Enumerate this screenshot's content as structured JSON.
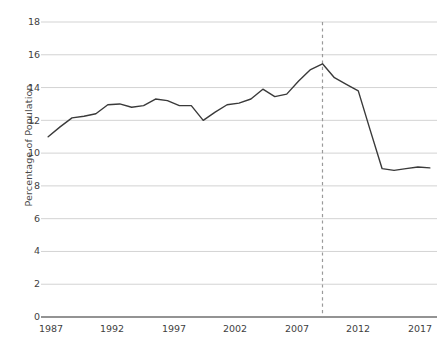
{
  "chart_data": {
    "type": "line",
    "title": "",
    "subtitle": "",
    "xlabel": "",
    "ylabel": "Percentage of Population",
    "xlim": [
      1986.4,
      2019.6
    ],
    "ylim": [
      0,
      18
    ],
    "grid": true,
    "grid_axis": "y",
    "legend": false,
    "legend_position": "none",
    "line_color": "#3a3a3a",
    "grid_color": "#d3d3d3",
    "axis_color": "#6f6f6f",
    "background_color": "#ffffff",
    "x": [
      1987,
      1988,
      1989,
      1990,
      1991,
      1992,
      1993,
      1994,
      1995,
      1996,
      1997,
      1998,
      1999,
      2000,
      2001,
      2002,
      2003,
      2004,
      2005,
      2006,
      2007,
      2008,
      2009,
      2010,
      2011,
      2012,
      2013,
      2014,
      2015,
      2016,
      2017,
      2018,
      2019
    ],
    "values": [
      11.0,
      11.6,
      12.15,
      12.25,
      12.4,
      12.95,
      13.0,
      12.8,
      12.9,
      13.3,
      13.2,
      12.9,
      12.9,
      12.0,
      12.5,
      12.95,
      13.05,
      13.3,
      13.9,
      13.45,
      13.6,
      14.4,
      15.1,
      15.45,
      14.6,
      14.2,
      13.8,
      11.4,
      9.05,
      8.95,
      9.05,
      9.15,
      9.1
    ],
    "series": [
      {
        "name": "Percentage of Population",
        "values": [
          11.0,
          11.6,
          12.15,
          12.25,
          12.4,
          12.95,
          13.0,
          12.8,
          12.9,
          13.3,
          13.2,
          12.9,
          12.9,
          12.0,
          12.5,
          12.95,
          13.05,
          13.3,
          13.9,
          13.45,
          13.6,
          14.4,
          15.1,
          15.45,
          14.6,
          14.2,
          13.8,
          11.4,
          9.05,
          8.95,
          9.05,
          9.15,
          9.1
        ]
      }
    ],
    "y_ticks": [
      0,
      2,
      4,
      6,
      8,
      10,
      12,
      14,
      16,
      18
    ],
    "y_tick_labels": [
      "0",
      "2",
      "4",
      "6",
      "8",
      "10",
      "12",
      "14",
      "16",
      "18"
    ],
    "x_ticks": [
      1987,
      1992,
      1997,
      2002,
      2007,
      2012,
      2017
    ],
    "x_tick_labels": [
      "1987",
      "1992",
      "1997",
      "2002",
      "2007",
      "2012",
      "2017"
    ],
    "annotations": [
      {
        "type": "vertical-dashed-line",
        "name": "reference-line-2010",
        "x": 2010,
        "label": "",
        "color": "#9a9a9a"
      }
    ]
  }
}
